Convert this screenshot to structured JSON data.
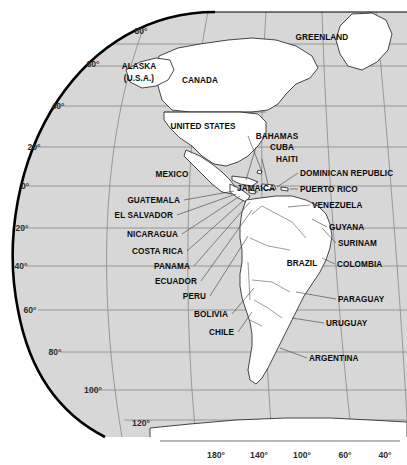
{
  "map": {
    "title": "Americas map with graticule",
    "projection": "globe-edge",
    "colors": {
      "ocean": "#d7d7d7",
      "land": "#ffffff",
      "coastline": "#1a1a1a",
      "graticule": "#8a8a8a",
      "limb": "#000000",
      "label": "#0b0b0b"
    }
  },
  "latitude_labels": [
    {
      "text": "80°",
      "x": 141,
      "y": 31,
      "align": "c"
    },
    {
      "text": "60°",
      "x": 93,
      "y": 64,
      "align": "c"
    },
    {
      "text": "40°",
      "x": 58,
      "y": 106,
      "align": "c"
    },
    {
      "text": "20°",
      "x": 34,
      "y": 147,
      "align": "c"
    },
    {
      "text": "0°",
      "x": 25,
      "y": 186,
      "align": "c"
    },
    {
      "text": "20°",
      "x": 22,
      "y": 228,
      "align": "c"
    },
    {
      "text": "40°",
      "x": 21,
      "y": 266,
      "align": "c"
    },
    {
      "text": "60°",
      "x": 30,
      "y": 310,
      "align": "c"
    },
    {
      "text": "80°",
      "x": 55,
      "y": 352,
      "align": "c"
    },
    {
      "text": "100°",
      "x": 93,
      "y": 390,
      "align": "c"
    },
    {
      "text": "120°",
      "x": 141,
      "y": 423,
      "align": "c"
    }
  ],
  "longitude_labels": [
    {
      "text": "180°",
      "x": 216,
      "y": 455,
      "align": "c"
    },
    {
      "text": "140°",
      "x": 259,
      "y": 455,
      "align": "c"
    },
    {
      "text": "100°",
      "x": 302,
      "y": 455,
      "align": "c"
    },
    {
      "text": "60°",
      "x": 345,
      "y": 455,
      "align": "c"
    },
    {
      "text": "40°",
      "x": 385,
      "y": 455,
      "align": "c"
    }
  ],
  "place_labels": [
    {
      "name": "GREENLAND",
      "text": "GREENLAND",
      "x": 322,
      "y": 37,
      "align": "c"
    },
    {
      "name": "ALASKA",
      "text": "ALASKA",
      "x": 139,
      "y": 66,
      "align": "c"
    },
    {
      "name": "ALASKA-USA",
      "text": "(U.S.A.)",
      "x": 139,
      "y": 78,
      "align": "c"
    },
    {
      "name": "CANADA",
      "text": "CANADA",
      "x": 200,
      "y": 80,
      "align": "c"
    },
    {
      "name": "UNITED-STATES",
      "text": "UNITED STATES",
      "x": 203,
      "y": 126,
      "align": "c"
    },
    {
      "name": "MEXICO",
      "text": "MEXICO",
      "x": 172,
      "y": 174,
      "align": "c"
    },
    {
      "name": "BAHAMAS",
      "text": "BAHAMAS",
      "x": 277,
      "y": 136,
      "align": "c"
    },
    {
      "name": "CUBA",
      "text": "CUBA",
      "x": 282,
      "y": 147,
      "align": "c"
    },
    {
      "name": "HAITI",
      "text": "HAITI",
      "x": 287,
      "y": 159,
      "align": "c"
    },
    {
      "name": "DOMINICAN-REPUBLIC",
      "text": "DOMINICAN REPUBLIC",
      "x": 300,
      "y": 173,
      "align": "l"
    },
    {
      "name": "JAMAICA",
      "text": "JAMAICA",
      "x": 256,
      "y": 188,
      "align": "c"
    },
    {
      "name": "PUERTO-RICO",
      "text": "PUERTO RICO",
      "x": 300,
      "y": 189,
      "align": "l"
    },
    {
      "name": "VENEZUELA",
      "text": "VENEZUELA",
      "x": 312,
      "y": 205,
      "align": "l"
    },
    {
      "name": "GUYANA",
      "text": "GUYANA",
      "x": 329,
      "y": 227,
      "align": "l"
    },
    {
      "name": "SURINAM",
      "text": "SURINAM",
      "x": 338,
      "y": 243,
      "align": "l"
    },
    {
      "name": "COLOMBIA",
      "text": "COLOMBIA",
      "x": 337,
      "y": 264,
      "align": "l"
    },
    {
      "name": "BRAZIL",
      "text": "BRAZIL",
      "x": 302,
      "y": 263,
      "align": "c"
    },
    {
      "name": "PARAGUAY",
      "text": "PARAGUAY",
      "x": 338,
      "y": 299,
      "align": "l"
    },
    {
      "name": "URUGUAY",
      "text": "URUGUAY",
      "x": 326,
      "y": 323,
      "align": "l"
    },
    {
      "name": "ARGENTINA",
      "text": "ARGENTINA",
      "x": 309,
      "y": 358,
      "align": "l"
    },
    {
      "name": "GUATEMALA",
      "text": "GUATEMALA",
      "x": 180,
      "y": 200,
      "align": "r"
    },
    {
      "name": "EL-SALVADOR",
      "text": "EL SALVADOR",
      "x": 173,
      "y": 215,
      "align": "r"
    },
    {
      "name": "NICARAGUA",
      "text": "NICARAGUA",
      "x": 178,
      "y": 234,
      "align": "r"
    },
    {
      "name": "COSTA-RICA",
      "text": "COSTA RICA",
      "x": 183,
      "y": 251,
      "align": "r"
    },
    {
      "name": "PANAMA",
      "text": "PANAMA",
      "x": 190,
      "y": 266,
      "align": "r"
    },
    {
      "name": "ECUADOR",
      "text": "ECUADOR",
      "x": 197,
      "y": 281,
      "align": "r"
    },
    {
      "name": "PERU",
      "text": "PERU",
      "x": 206,
      "y": 296,
      "align": "r"
    },
    {
      "name": "BOLIVIA",
      "text": "BOLIVIA",
      "x": 228,
      "y": 314,
      "align": "r"
    },
    {
      "name": "CHILE",
      "text": "CHILE",
      "x": 234,
      "y": 332,
      "align": "r"
    }
  ]
}
